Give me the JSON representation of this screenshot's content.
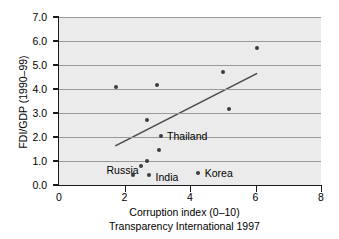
{
  "chart_data": {
    "type": "scatter",
    "title": "",
    "xlabel": "Corruption index (0–10)",
    "sublabel": "Transparency International 1997",
    "ylabel": "FDI/GDP (1990–99)",
    "xlim": [
      0,
      8
    ],
    "ylim": [
      0.0,
      7.0
    ],
    "xticks": [
      "0",
      "2",
      "4",
      "6",
      "8"
    ],
    "xtick_values": [
      0,
      2,
      4,
      6,
      8
    ],
    "yticks": [
      "0.0",
      "1.0",
      "2.0",
      "3.0",
      "4.0",
      "5.0",
      "6.0",
      "7.0"
    ],
    "ytick_values": [
      0.0,
      1.0,
      2.0,
      3.0,
      4.0,
      5.0,
      6.0,
      7.0
    ],
    "grid": "horizontal",
    "legend": "none",
    "marker_color": "#3d3d3d",
    "trendline_color": "#4a4a4a",
    "plot_background": "#ebebeb",
    "gridline_color": "#9a9a9a",
    "points": [
      {
        "x": 1.75,
        "y": 4.1,
        "label": ""
      },
      {
        "x": 2.25,
        "y": 0.4,
        "label": "Russia"
      },
      {
        "x": 2.5,
        "y": 0.8,
        "label": ""
      },
      {
        "x": 2.7,
        "y": 1.0,
        "label": ""
      },
      {
        "x": 2.7,
        "y": 2.7,
        "label": ""
      },
      {
        "x": 2.75,
        "y": 0.4,
        "label": "India"
      },
      {
        "x": 3.0,
        "y": 4.15,
        "label": ""
      },
      {
        "x": 3.05,
        "y": 1.45,
        "label": ""
      },
      {
        "x": 3.1,
        "y": 2.05,
        "label": "Thailand"
      },
      {
        "x": 4.25,
        "y": 0.5,
        "label": "Korea"
      },
      {
        "x": 5.0,
        "y": 4.7,
        "label": ""
      },
      {
        "x": 5.2,
        "y": 3.15,
        "label": ""
      },
      {
        "x": 6.05,
        "y": 5.7,
        "label": ""
      }
    ],
    "trendline": {
      "x0": 1.72,
      "y0": 1.63,
      "x1": 6.05,
      "y1": 4.65
    },
    "annotations": [
      {
        "text": "Thailand",
        "x": 3.3,
        "y": 2.05
      },
      {
        "text": "Russia",
        "x": 1.45,
        "y": 0.62
      },
      {
        "text": "India",
        "x": 2.95,
        "y": 0.33
      },
      {
        "text": "Korea",
        "x": 4.45,
        "y": 0.5
      }
    ]
  }
}
